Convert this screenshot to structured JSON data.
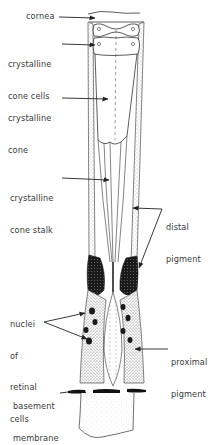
{
  "diagram": {
    "stroke_color": "#222222",
    "text_color": "#3a3a3a",
    "background": "#ffffff",
    "labels": [
      {
        "id": "cornea",
        "text": "cornea"
      },
      {
        "id": "crystalline_cone_cells",
        "line1": "crystalline",
        "line2": "cone cells"
      },
      {
        "id": "crystalline_cone",
        "line1": "crystalline",
        "line2": "cone"
      },
      {
        "id": "crystalline_cone_stalk",
        "line1": "crystalline",
        "line2": "cone stalk"
      },
      {
        "id": "distal_pigment",
        "line1": "distal",
        "line2": "pigment"
      },
      {
        "id": "nuclei_of_retinal_cells",
        "line1": "nuclei",
        "line2": "of",
        "line3": "retinal",
        "line4": "cells"
      },
      {
        "id": "proximal_pigment",
        "line1": "proximal",
        "line2": "pigment"
      },
      {
        "id": "basement_membrane",
        "line1": "basement",
        "line2": "membrane"
      }
    ]
  }
}
